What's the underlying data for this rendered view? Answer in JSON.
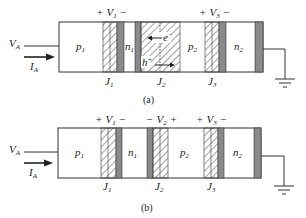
{
  "figure": {
    "colors": {
      "line": "#333333",
      "dark_bar": "#8a8a8a",
      "hatch": "#444444",
      "background": "#ffffff"
    },
    "panels": [
      {
        "caption": "(a)",
        "input_voltage": {
          "main": "V",
          "sub": "A"
        },
        "input_current": {
          "main": "I",
          "sub": "A"
        },
        "regions": [
          {
            "main": "p",
            "sub": "1"
          },
          {
            "main": "n",
            "sub": "1"
          },
          {
            "main": "p",
            "sub": "2"
          },
          {
            "main": "n",
            "sub": "2"
          }
        ],
        "junctions": [
          {
            "main": "J",
            "sub": "1"
          },
          {
            "main": "J",
            "sub": "2"
          },
          {
            "main": "J",
            "sub": "3"
          }
        ],
        "voltages": [
          {
            "plus_left": "+",
            "main": "V",
            "sub": "1",
            "minus_right": "−"
          },
          {
            "plus_left": "+",
            "main": "V",
            "sub": "3",
            "minus_right": "−"
          }
        ],
        "carriers": [
          {
            "main": "e",
            "sup": "−",
            "direction": "left"
          },
          {
            "main": "h",
            "sup": "+",
            "direction": "right"
          }
        ]
      },
      {
        "caption": "(b)",
        "input_voltage": {
          "main": "V",
          "sub": "A"
        },
        "input_current": {
          "main": "I",
          "sub": "A"
        },
        "regions": [
          {
            "main": "p",
            "sub": "1"
          },
          {
            "main": "n",
            "sub": "1"
          },
          {
            "main": "p",
            "sub": "2"
          },
          {
            "main": "n",
            "sub": "2"
          }
        ],
        "junctions": [
          {
            "main": "J",
            "sub": "1"
          },
          {
            "main": "J",
            "sub": "2"
          },
          {
            "main": "J",
            "sub": "3"
          }
        ],
        "voltages": [
          {
            "plus_left": "+",
            "main": "V",
            "sub": "1",
            "minus_right": "−"
          },
          {
            "plus_left": "−",
            "main": "V",
            "sub": "2",
            "minus_right": "+"
          },
          {
            "plus_left": "+",
            "main": "V",
            "sub": "3",
            "minus_right": "−"
          }
        ]
      }
    ]
  }
}
